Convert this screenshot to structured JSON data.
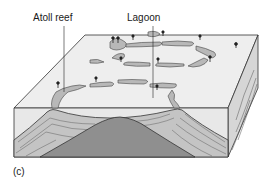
{
  "figure": {
    "panel_label": "(c)",
    "labels": {
      "atoll_reef": "Atoll reef",
      "lagoon": "Lagoon"
    },
    "colors": {
      "top_surface": "#ececec",
      "front_face": "#e6e6e6",
      "side_face": "#d2d2d2",
      "reef": "#b8b8b8",
      "sediment": "#c9c9c9",
      "volcanic_core": "#8f8f8f",
      "outline": "#333333"
    }
  }
}
